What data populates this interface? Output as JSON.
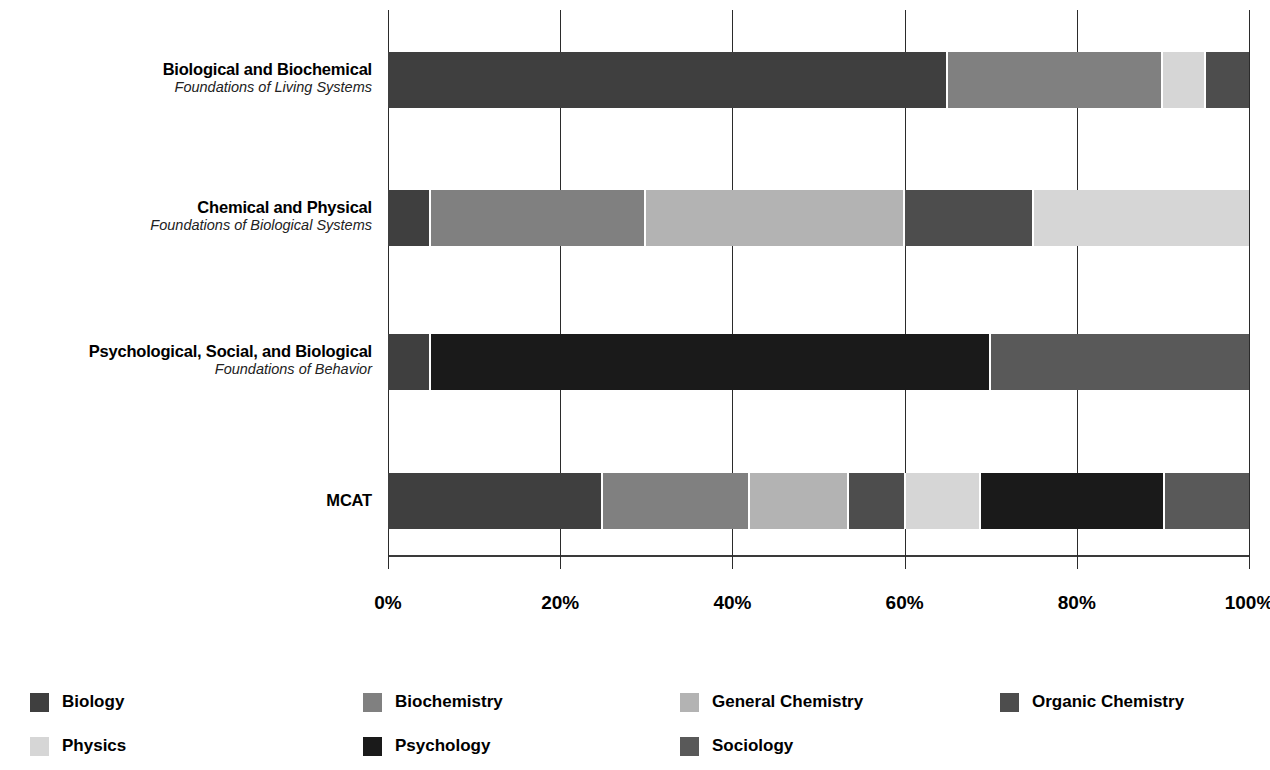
{
  "chart_data": {
    "type": "bar",
    "orientation": "horizontal",
    "stacked": true,
    "normalized": true,
    "title": "",
    "xlabel": "",
    "ylabel": "",
    "xlim": [
      0,
      100
    ],
    "grid": true,
    "legend_position": "bottom",
    "xticks": [
      "0%",
      "20%",
      "40%",
      "60%",
      "80%",
      "100%"
    ],
    "xtick_values": [
      0,
      20,
      40,
      60,
      80,
      100
    ],
    "categories": [
      {
        "title": "Biological and Biochemical",
        "subtitle": "Foundations of Living Systems"
      },
      {
        "title": "Chemical and Physical",
        "subtitle": "Foundations of Biological Systems"
      },
      {
        "title": "Psychological, Social, and Biological",
        "subtitle": "Foundations of Behavior"
      },
      {
        "title": "MCAT",
        "subtitle": ""
      }
    ],
    "series": [
      {
        "name": "Biology",
        "color": "#3f3f3f",
        "values": [
          65,
          5,
          5,
          25
        ]
      },
      {
        "name": "Biochemistry",
        "color": "#808080",
        "values": [
          25,
          25,
          0,
          17
        ]
      },
      {
        "name": "General Chemistry",
        "color": "#b3b3b3",
        "values": [
          0,
          30,
          0,
          11.6
        ]
      },
      {
        "name": "Organic Chemistry",
        "color": "#4d4d4d",
        "values": [
          5,
          15,
          0,
          6.6
        ]
      },
      {
        "name": "Physics",
        "color": "#d6d6d6",
        "values": [
          5,
          25,
          0,
          8.7
        ]
      },
      {
        "name": "Psychology",
        "color": "#1a1a1a",
        "values": [
          0,
          0,
          65,
          21.4
        ]
      },
      {
        "name": "Sociology",
        "color": "#595959",
        "values": [
          0,
          0,
          30,
          9.7
        ]
      }
    ],
    "bars": [
      {
        "category": "Biological and Biochemical",
        "segments": [
          {
            "name": "Biology",
            "value": 65
          },
          {
            "name": "Biochemistry",
            "value": 25
          },
          {
            "name": "Physics",
            "value": 5
          },
          {
            "name": "Organic Chemistry",
            "value": 5
          }
        ]
      },
      {
        "category": "Chemical and Physical",
        "segments": [
          {
            "name": "Biology",
            "value": 5
          },
          {
            "name": "Biochemistry",
            "value": 25
          },
          {
            "name": "General Chemistry",
            "value": 30
          },
          {
            "name": "Organic Chemistry",
            "value": 15
          },
          {
            "name": "Physics",
            "value": 25
          }
        ]
      },
      {
        "category": "Psychological, Social, and Biological",
        "segments": [
          {
            "name": "Biology",
            "value": 5
          },
          {
            "name": "Psychology",
            "value": 65
          },
          {
            "name": "Sociology",
            "value": 30
          }
        ]
      },
      {
        "category": "MCAT",
        "segments": [
          {
            "name": "Biology",
            "value": 25
          },
          {
            "name": "Biochemistry",
            "value": 17
          },
          {
            "name": "General Chemistry",
            "value": 11.6
          },
          {
            "name": "Organic Chemistry",
            "value": 6.6
          },
          {
            "name": "Physics",
            "value": 8.7
          },
          {
            "name": "Psychology",
            "value": 21.4
          },
          {
            "name": "Sociology",
            "value": 9.7
          }
        ]
      }
    ]
  },
  "legend": {
    "rows": [
      [
        {
          "label": "Biology",
          "color": "#3f3f3f",
          "x": 30,
          "series": "Biology"
        },
        {
          "label": "Biochemistry",
          "color": "#808080",
          "x": 363,
          "series": "Biochemistry"
        },
        {
          "label": "General Chemistry",
          "color": "#b3b3b3",
          "x": 680,
          "series": "General Chemistry"
        },
        {
          "label": "Organic Chemistry",
          "color": "#4d4d4d",
          "x": 1000,
          "series": "Organic Chemistry"
        }
      ],
      [
        {
          "label": "Physics",
          "color": "#d6d6d6",
          "x": 30,
          "series": "Physics"
        },
        {
          "label": "Psychology",
          "color": "#1a1a1a",
          "x": 363,
          "series": "Psychology"
        },
        {
          "label": "Sociology",
          "color": "#595959",
          "x": 680,
          "series": "Sociology"
        }
      ]
    ]
  },
  "layout": {
    "plot_left": 388,
    "plot_width": 861,
    "bar_tops": [
      52,
      190,
      334,
      473
    ],
    "bar_height": 56,
    "axis_top": 555
  }
}
